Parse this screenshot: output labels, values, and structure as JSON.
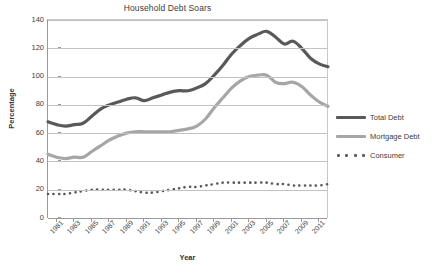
{
  "chart_data": {
    "type": "line",
    "title": "Household Debt Soars",
    "xlabel": "Year",
    "ylabel": "Percentage",
    "ylim": [
      0,
      140
    ],
    "ytick_step": 20,
    "yticks": [
      140,
      120,
      100,
      80,
      60,
      40,
      20,
      0
    ],
    "grid": "horizontal",
    "legend_position": "right",
    "x": [
      1980,
      1981,
      1982,
      1983,
      1984,
      1985,
      1986,
      1987,
      1988,
      1989,
      1990,
      1991,
      1992,
      1993,
      1994,
      1995,
      1996,
      1997,
      1998,
      1999,
      2000,
      2001,
      2002,
      2003,
      2004,
      2005,
      2006,
      2007,
      2008,
      2009,
      2010,
      2011,
      2012
    ],
    "xtick_labels": [
      "1981",
      "1983",
      "1985",
      "1987",
      "1989",
      "1991",
      "1993",
      "1995",
      "1997",
      "1999",
      "2001",
      "2003",
      "2005",
      "2007",
      "2009",
      "2011"
    ],
    "series": [
      {
        "name": "Total Debt",
        "style": "solid",
        "color": "#595959",
        "values": [
          68,
          66,
          65,
          66,
          67,
          72,
          77,
          80,
          82,
          84,
          85,
          83,
          85,
          87,
          89,
          90,
          90,
          92,
          95,
          101,
          108,
          116,
          122,
          127,
          130,
          132,
          128,
          123,
          125,
          120,
          113,
          109,
          107
        ]
      },
      {
        "name": "Mortgage Debt",
        "style": "solid",
        "color": "#a6a6a6",
        "values": [
          45,
          43,
          42,
          43,
          43,
          47,
          51,
          55,
          58,
          60,
          61,
          61,
          61,
          61,
          61,
          62,
          63,
          65,
          70,
          78,
          85,
          92,
          97,
          100,
          101,
          101,
          96,
          95,
          96,
          93,
          87,
          82,
          79
        ]
      },
      {
        "name": "Consumer",
        "style": "dotted",
        "color": "#595959",
        "values": [
          17,
          17,
          17,
          18,
          19,
          20,
          20,
          20,
          20,
          20,
          19,
          18,
          18,
          19,
          20,
          21,
          22,
          22,
          23,
          24,
          25,
          25,
          25,
          25,
          25,
          25,
          24,
          24,
          23,
          23,
          23,
          23,
          24
        ]
      }
    ]
  },
  "legend": {
    "items": [
      {
        "label": "Total Debt"
      },
      {
        "label": "Mortgage Debt"
      },
      {
        "label": "Consumer"
      }
    ]
  }
}
